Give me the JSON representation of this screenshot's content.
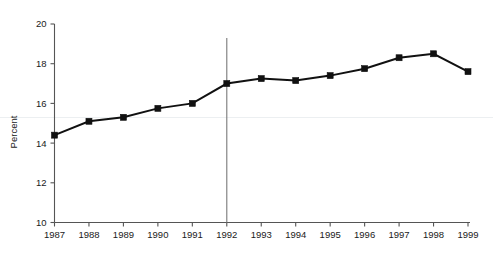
{
  "chart_data": {
    "type": "line",
    "title": "",
    "xlabel": "",
    "ylabel": "Percent",
    "categories": [
      "1987",
      "1988",
      "1989",
      "1990",
      "1991",
      "1992",
      "1993",
      "1994",
      "1995",
      "1996",
      "1997",
      "1998",
      "1999"
    ],
    "values": [
      14.4,
      15.1,
      15.3,
      15.75,
      16.0,
      17.0,
      17.25,
      17.15,
      17.4,
      17.75,
      18.3,
      18.5,
      17.6
    ],
    "x": [
      1987,
      1988,
      1989,
      1990,
      1991,
      1992,
      1993,
      1994,
      1995,
      1996,
      1997,
      1998,
      1999
    ],
    "xlim": [
      1987,
      1999
    ],
    "ylim": [
      10,
      20
    ],
    "y_ticks": [
      "10",
      "12",
      "14",
      "16",
      "18",
      "20"
    ],
    "y_tick_values": [
      10,
      12,
      14,
      16,
      18,
      20
    ],
    "x_ticks": [
      "1987",
      "1988",
      "1989",
      "1990",
      "1991",
      "1992",
      "1993",
      "1994",
      "1995",
      "1996",
      "1997",
      "1998",
      "1999"
    ],
    "grid": false,
    "legend": null,
    "legend_position": "none",
    "marker": "square",
    "annotations": [
      {
        "name": "reference-line-1992",
        "type": "vline",
        "x": 1992,
        "label": ""
      }
    ],
    "series": [
      {
        "name": "Percent",
        "values": [
          14.4,
          15.1,
          15.3,
          15.75,
          16.0,
          17.0,
          17.25,
          17.15,
          17.4,
          17.75,
          18.3,
          18.5,
          17.6
        ]
      }
    ]
  },
  "colors": {
    "series": "#111111",
    "axis": "#555555",
    "reference_line": "#7a7a7a",
    "background": "#ffffff",
    "text": "#1a1a1a"
  },
  "axis": {
    "y_title": "Percent"
  }
}
